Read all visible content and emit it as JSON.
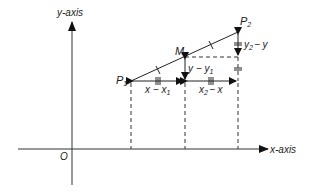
{
  "diagram": {
    "type": "midpoint-of-line-segment",
    "axes": {
      "x_label": "x-axis",
      "y_label": "y-axis",
      "origin_label": "O"
    },
    "points": [
      {
        "name": "P1",
        "label": "P",
        "sub": "1"
      },
      {
        "name": "M",
        "label": "M"
      },
      {
        "name": "P2",
        "label": "P",
        "sub": "2"
      }
    ],
    "segment_labels": {
      "x_minus_x1": {
        "main": "x − x",
        "sub": "1"
      },
      "x2_minus_x": {
        "pre": "x",
        "sub": "2",
        "post": "− x"
      },
      "y_minus_y1": {
        "main": "y − y",
        "sub": "1"
      },
      "y2_minus_y": {
        "pre": "y",
        "sub": "2",
        "post": "− y"
      }
    }
  }
}
